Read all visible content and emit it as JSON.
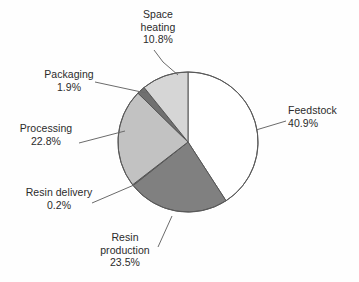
{
  "figure": {
    "background_color": "#fefefe",
    "text_color": "#2b2b2b",
    "outline_color": "#555555"
  },
  "chart_data": {
    "type": "pie",
    "title": "",
    "subtitle": "",
    "xlabel": "",
    "ylabel": "",
    "legend_position": "none",
    "grid": false,
    "units": "percent",
    "start_angle_deg": 0,
    "direction": "clockwise",
    "total": 100.1,
    "categories": [
      "Feedstock",
      "Resin production",
      "Resin delivery",
      "Processing",
      "Packaging",
      "Space heating"
    ],
    "values": [
      40.9,
      23.5,
      0.2,
      22.8,
      1.9,
      10.8
    ],
    "value_labels": [
      "40.9%",
      "23.5%",
      "0.2%",
      "22.8%",
      "1.9%",
      "10.8%"
    ],
    "slice_colors": [
      "#ffffff",
      "#808080",
      "#6e6e6e",
      "#c2c2c2",
      "#707070",
      "#d6d6d6"
    ],
    "slices": [
      {
        "name": "Feedstock",
        "label_line1": "Feedstock",
        "label_line2": "40.9%",
        "value": 40.9,
        "value_text": "40.9%",
        "color": "#ffffff"
      },
      {
        "name": "Resin production",
        "label_line1": "Resin",
        "label_line2": "production",
        "label_line3": "23.5%",
        "value": 23.5,
        "value_text": "23.5%",
        "color": "#808080"
      },
      {
        "name": "Resin delivery",
        "label_line1": "Resin delivery",
        "label_line2": "0.2%",
        "value": 0.2,
        "value_text": "0.2%",
        "color": "#6e6e6e"
      },
      {
        "name": "Processing",
        "label_line1": "Processing",
        "label_line2": "22.8%",
        "value": 22.8,
        "value_text": "22.8%",
        "color": "#c2c2c2"
      },
      {
        "name": "Packaging",
        "label_line1": "Packaging",
        "label_line2": "1.9%",
        "value": 1.9,
        "value_text": "1.9%",
        "color": "#707070"
      },
      {
        "name": "Space heating",
        "label_line1": "Space",
        "label_line2": "heating",
        "label_line3": "10.8%",
        "value": 10.8,
        "value_text": "10.8%",
        "color": "#d6d6d6"
      }
    ]
  }
}
